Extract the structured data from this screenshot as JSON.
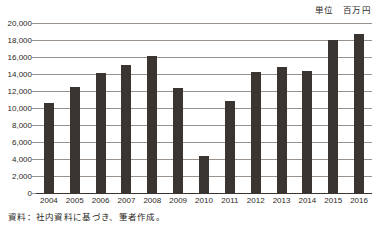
{
  "unit_caption": "単位　百万円",
  "source_note": "資料：社内資料に基づき、筆者作成。",
  "chart_data": {
    "type": "bar",
    "title": "",
    "subtitle": "",
    "xlabel": "",
    "ylabel": "",
    "unit_label": "単位　百万円",
    "source": "資料：社内資料に基づき、筆者作成。",
    "categories": [
      "2004",
      "2005",
      "2006",
      "2007",
      "2008",
      "2009",
      "2010",
      "2011",
      "2012",
      "2013",
      "2014",
      "2015",
      "2016"
    ],
    "values": [
      10600,
      12450,
      14100,
      15100,
      16100,
      12300,
      4400,
      10850,
      14200,
      14800,
      14300,
      17950,
      18650
    ],
    "ylim": [
      0,
      20000
    ],
    "ytick_step": 2000,
    "ytick_labels": [
      "20,000",
      "18,000",
      "16,000",
      "14,000",
      "12,000",
      "10,000",
      "8,000",
      "6,000",
      "4,000",
      "2,000",
      "0"
    ],
    "ytick_values": [
      20000,
      18000,
      16000,
      14000,
      12000,
      10000,
      8000,
      6000,
      4000,
      2000,
      0
    ],
    "grid": true,
    "legend": false,
    "legend_position": "none",
    "bar_color": "#3a3531",
    "grid_color": "#9a938d",
    "axis_color": "#3a3531",
    "background": "#ffffff",
    "series": [
      {
        "name": "金額",
        "values": [
          10600,
          12450,
          14100,
          15100,
          16100,
          12300,
          4400,
          10850,
          14200,
          14800,
          14300,
          17950,
          18650
        ]
      }
    ]
  }
}
